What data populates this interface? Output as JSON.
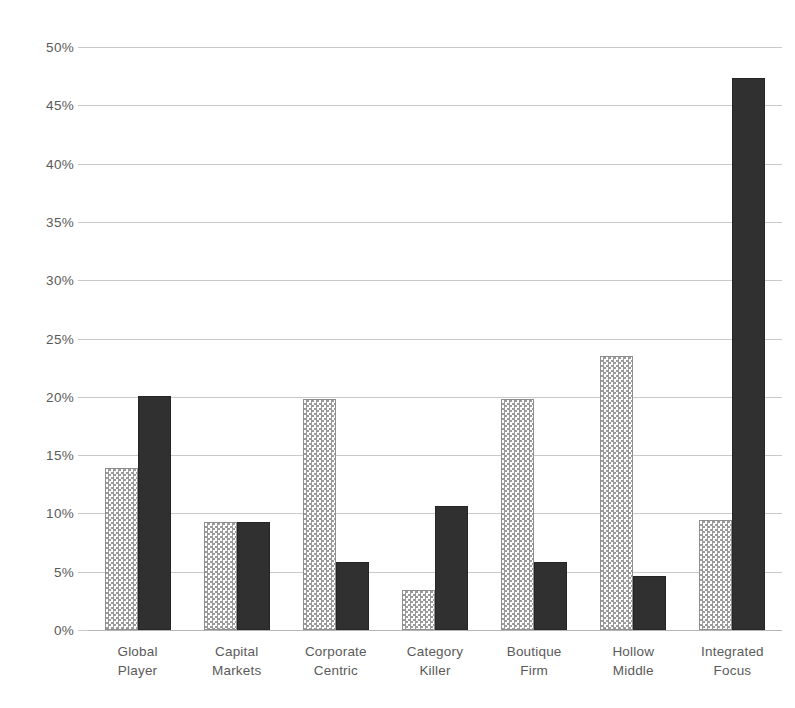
{
  "chart_data": {
    "type": "bar",
    "title": "",
    "subtitle": "",
    "xlabel": "",
    "ylabel": "",
    "categories": [
      "Global Player",
      "Capital Markets",
      "Corporate Centric",
      "Category Killer",
      "Boutique Firm",
      "Hollow Middle",
      "Integrated Focus"
    ],
    "category_lines": [
      [
        "Global",
        "Player"
      ],
      [
        "Capital",
        "Markets"
      ],
      [
        "Corporate",
        "Centric"
      ],
      [
        "Category",
        "Killer"
      ],
      [
        "Boutique",
        "Firm"
      ],
      [
        "Hollow",
        "Middle"
      ],
      [
        "Integrated",
        "Focus"
      ]
    ],
    "series": [
      {
        "name": "Series 1",
        "pattern": "checkered",
        "color": "#9a9a9a",
        "values": [
          13.9,
          9.3,
          19.8,
          3.4,
          19.8,
          23.5,
          9.4
        ]
      },
      {
        "name": "Series 2",
        "pattern": "solid",
        "color": "#303030",
        "values": [
          20.1,
          9.3,
          5.8,
          10.6,
          5.8,
          4.6,
          47.3
        ]
      }
    ],
    "ylim": [
      0,
      50
    ],
    "ytick_step": 5,
    "ytick_labels": [
      "0%",
      "5%",
      "10%",
      "15%",
      "20%",
      "25%",
      "30%",
      "35%",
      "40%",
      "45%",
      "50%"
    ],
    "ytick_values": [
      0,
      5,
      10,
      15,
      20,
      25,
      30,
      35,
      40,
      45,
      50
    ],
    "grid": true,
    "grid_axis": "y",
    "legend": false,
    "legend_position": "none",
    "value_unit": "%",
    "background_color": "#ffffff",
    "gridline_color": "#c9c9c9",
    "axis_text_color": "#5a5a5a"
  }
}
